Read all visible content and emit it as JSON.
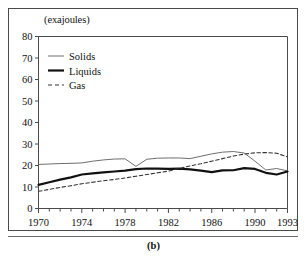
{
  "figure": {
    "caption": "(b)",
    "unit_label": "(exajoules)"
  },
  "chart_data": {
    "type": "line",
    "title": "",
    "subtitle": "",
    "xlabel": "",
    "ylabel": "(exajoules)",
    "xlim": [
      1970,
      1993
    ],
    "ylim": [
      0,
      80
    ],
    "grid": false,
    "legend_position": "top-left",
    "ytick_labels": [
      "0",
      "10",
      "20",
      "30",
      "40",
      "50",
      "60",
      "70",
      "80"
    ],
    "ytick_values": [
      0,
      10,
      20,
      30,
      40,
      50,
      60,
      70,
      80
    ],
    "xtick_labels": [
      "1970",
      "1974",
      "1978",
      "1982",
      "1986",
      "1990",
      "1993"
    ],
    "xtick_values": [
      1970,
      1974,
      1978,
      1982,
      1986,
      1990,
      1993
    ],
    "x_minor_ticks": [
      1970,
      1971,
      1972,
      1973,
      1974,
      1975,
      1976,
      1977,
      1978,
      1979,
      1980,
      1981,
      1982,
      1983,
      1984,
      1985,
      1986,
      1987,
      1988,
      1989,
      1990,
      1991,
      1992,
      1993
    ],
    "x": [
      1970,
      1971,
      1972,
      1973,
      1974,
      1975,
      1976,
      1977,
      1978,
      1979,
      1980,
      1981,
      1982,
      1983,
      1984,
      1985,
      1986,
      1987,
      1988,
      1989,
      1990,
      1991,
      1992,
      1993
    ],
    "series": [
      {
        "name": "Solids",
        "style": "solid-thin",
        "color": "#6e6e6e",
        "values": [
          20.5,
          20.7,
          20.9,
          21.0,
          21.2,
          22.0,
          22.6,
          23.0,
          23.1,
          19.6,
          22.9,
          23.4,
          23.5,
          23.5,
          23.2,
          24.3,
          25.4,
          26.2,
          26.5,
          25.8,
          22.0,
          17.9,
          18.6,
          17.5
        ]
      },
      {
        "name": "Liquids",
        "style": "solid-thick",
        "color": "#111111",
        "values": [
          11.0,
          12.2,
          13.4,
          14.5,
          15.8,
          16.3,
          16.8,
          17.2,
          17.6,
          18.3,
          18.6,
          18.5,
          18.4,
          18.5,
          18.2,
          17.6,
          16.9,
          17.7,
          17.8,
          18.8,
          18.4,
          16.6,
          15.8,
          17.2
        ]
      },
      {
        "name": "Gas",
        "style": "dashed",
        "color": "#333333",
        "values": [
          8.0,
          8.9,
          9.8,
          10.6,
          11.5,
          12.2,
          12.9,
          13.5,
          14.2,
          15.0,
          15.8,
          16.6,
          17.4,
          18.6,
          19.8,
          20.8,
          22.0,
          23.2,
          24.4,
          25.3,
          25.9,
          26.0,
          25.7,
          24.0
        ]
      }
    ]
  },
  "legend": {
    "entries": [
      {
        "label": "Solids"
      },
      {
        "label": "Liquids"
      },
      {
        "label": "Gas"
      }
    ]
  }
}
